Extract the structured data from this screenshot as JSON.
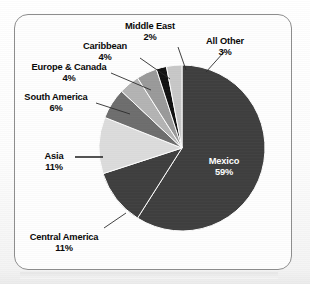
{
  "chart_data": {
    "type": "pie",
    "title": "",
    "subtitle": "",
    "xlabel": "",
    "ylabel": "",
    "legend_position": "none",
    "grid": false,
    "units": "percent",
    "start_angle_deg": 0,
    "direction": "clockwise",
    "categories": [
      "Mexico",
      "Central America",
      "Asia",
      "South America",
      "Europe & Canada",
      "Caribbean",
      "Middle East",
      "All Other"
    ],
    "values": [
      59,
      11,
      11,
      6,
      4,
      4,
      2,
      3
    ],
    "slices": [
      {
        "label": "Mexico",
        "value": 59,
        "pct_text": "59%",
        "color": "#3f3f3f",
        "label_placement": "inside",
        "label_color": "#ffffff",
        "leader": false
      },
      {
        "label": "Central America",
        "value": 11,
        "pct_text": "11%",
        "color": "#3f3f3f",
        "label_placement": "outside",
        "label_color": "#0a0a0a",
        "leader": true
      },
      {
        "label": "Asia",
        "value": 11,
        "pct_text": "11%",
        "color": "#dcdcdc",
        "label_placement": "outside",
        "label_color": "#0a0a0a",
        "leader": true
      },
      {
        "label": "South America",
        "value": 6,
        "pct_text": "6%",
        "color": "#6e6e6e",
        "label_placement": "outside",
        "label_color": "#0a0a0a",
        "leader": true
      },
      {
        "label": "Europe & Canada",
        "value": 4,
        "pct_text": "4%",
        "color": "#b4b4b4",
        "label_placement": "outside",
        "label_color": "#0a0a0a",
        "leader": true
      },
      {
        "label": "Caribbean",
        "value": 4,
        "pct_text": "4%",
        "color": "#9a9a9a",
        "label_placement": "outside",
        "label_color": "#0a0a0a",
        "leader": true
      },
      {
        "label": "Middle East",
        "value": 2,
        "pct_text": "2%",
        "color": "#111111",
        "label_placement": "outside",
        "label_color": "#0a0a0a",
        "leader": true
      },
      {
        "label": "All Other",
        "value": 3,
        "pct_text": "3%",
        "color": "#c8c8c8",
        "label_placement": "outside",
        "label_color": "#0a0a0a",
        "leader": true
      }
    ]
  },
  "labels": {
    "mexico": {
      "name": "Mexico",
      "pct": "59%"
    },
    "central_america": {
      "name": "Central America",
      "pct": "11%"
    },
    "asia": {
      "name": "Asia",
      "pct": "11%"
    },
    "south_america": {
      "name": "South America",
      "pct": "6%"
    },
    "europe_canada": {
      "name": "Europe & Canada",
      "pct": "4%"
    },
    "caribbean": {
      "name": "Caribbean",
      "pct": "4%"
    },
    "middle_east": {
      "name": "Middle East",
      "pct": "2%"
    },
    "all_other": {
      "name": "All Other",
      "pct": "3%"
    }
  },
  "style": {
    "frame_border": "#8e8e8e",
    "page_background": "#ffffff",
    "slice_outline": "#ffffff"
  }
}
